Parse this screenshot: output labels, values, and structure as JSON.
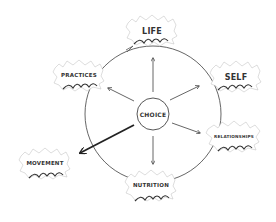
{
  "diagram": {
    "center": {
      "label": "CHOICE",
      "x": 153,
      "y": 114
    },
    "nodes": [
      {
        "id": "life",
        "label": "LIFE",
        "x": 152,
        "y": 31,
        "size": "big",
        "arrow": "thin"
      },
      {
        "id": "self",
        "label": "SELF",
        "x": 236,
        "y": 77,
        "size": "big",
        "arrow": "thin"
      },
      {
        "id": "relationships",
        "label": "RELATIONSHIPS",
        "x": 233,
        "y": 136,
        "size": "sm",
        "arrow": "thin"
      },
      {
        "id": "nutrition",
        "label": "NUTRITION",
        "x": 151,
        "y": 185,
        "size": "med",
        "arrow": "thin"
      },
      {
        "id": "movement",
        "label": "MOVEMENT",
        "x": 45,
        "y": 163,
        "size": "med",
        "arrow": "thick"
      },
      {
        "id": "practices",
        "label": "PRACTICES",
        "x": 79,
        "y": 75,
        "size": "med",
        "arrow": "thin"
      }
    ],
    "colors": {
      "ink": "#333333",
      "background": "#ffffff"
    }
  }
}
